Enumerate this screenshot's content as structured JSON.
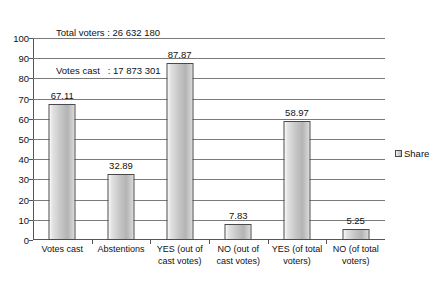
{
  "header": {
    "line1": "Total voters : 26 632 180",
    "line2": "Votes cast   : 17 873 301"
  },
  "legend": {
    "entries": [
      "Share"
    ],
    "position": "right",
    "swatch_color": "#bfbfbf"
  },
  "chart_data": {
    "type": "bar",
    "title": "",
    "subtitle": "",
    "xlabel": "",
    "ylabel": "",
    "ylim": [
      0,
      100
    ],
    "ytick_labels": [
      "0",
      "10",
      "20",
      "30",
      "40",
      "50",
      "60",
      "70",
      "80",
      "90",
      "100"
    ],
    "yticks": [
      0,
      10,
      20,
      30,
      40,
      50,
      60,
      70,
      80,
      90,
      100
    ],
    "grid": true,
    "categories": [
      "Votes cast",
      "Abstentions",
      "YES (out of cast votes)",
      "NO (out of cast votes)",
      "YES (of total voters)",
      "NO (of total voters)"
    ],
    "category_lines": [
      [
        "Votes cast"
      ],
      [
        "Abstentions"
      ],
      [
        "YES (out of",
        "cast votes)"
      ],
      [
        "NO (out of",
        "cast votes)"
      ],
      [
        "YES (of total",
        "voters)"
      ],
      [
        "NO (of total",
        "voters)"
      ]
    ],
    "series": [
      {
        "name": "Share",
        "values": [
          67.11,
          32.89,
          87.87,
          7.83,
          58.97,
          5.25
        ],
        "labels": [
          "67.11",
          "32.89",
          "87.87",
          "7.83",
          "58.97",
          "5.25"
        ]
      }
    ],
    "annotations": [
      "Total voters : 26 632 180",
      "Votes cast   : 17 873 301"
    ]
  }
}
